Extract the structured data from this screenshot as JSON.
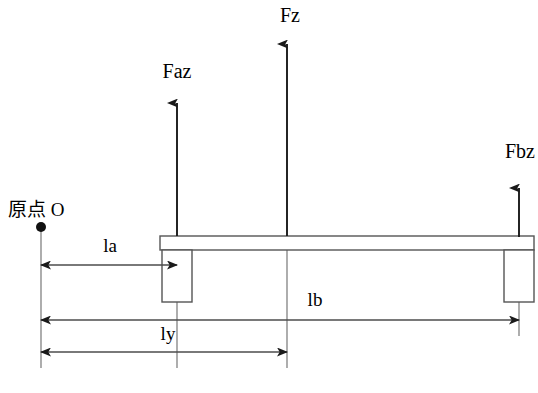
{
  "diagram": {
    "origin_label": "原点 O",
    "forces": [
      {
        "name": "Faz",
        "label": "Faz",
        "x": 177,
        "tail_y": 236,
        "head_y": 97,
        "label_x": 177,
        "label_y": 78
      },
      {
        "name": "Fz",
        "label": "Fz",
        "x": 287,
        "tail_y": 236,
        "head_y": 38,
        "label_x": 290,
        "label_y": 22
      },
      {
        "name": "Fbz",
        "label": "Fbz",
        "x": 519,
        "tail_y": 237,
        "head_y": 182,
        "label_x": 520,
        "label_y": 158
      }
    ],
    "dimensions": [
      {
        "name": "la",
        "label": "la",
        "x1": 41,
        "x2": 177,
        "y": 265,
        "label_x": 110,
        "label_y": 252,
        "both_arrows": true
      },
      {
        "name": "lb",
        "label": "lb",
        "x1": 41,
        "x2": 519,
        "y": 320,
        "label_x": 315,
        "label_y": 306,
        "both_arrows": true
      },
      {
        "name": "ly",
        "label": "ly",
        "x1": 41,
        "x2": 287,
        "y": 352,
        "label_x": 168,
        "label_y": 340,
        "both_arrows": true
      }
    ],
    "origin": {
      "dot_x": 41,
      "dot_y": 227,
      "label_x": 8,
      "label_y": 216
    },
    "beam": {
      "x1": 160,
      "x2": 534,
      "top_y": 236,
      "bottom_y": 250
    },
    "supports": [
      {
        "name": "left-support",
        "x1": 162,
        "x2": 192,
        "top_y": 250,
        "bottom_y": 302
      },
      {
        "name": "right-support",
        "x1": 504,
        "x2": 534,
        "top_y": 250,
        "bottom_y": 302
      }
    ],
    "colors": {
      "stroke": "#555555",
      "arrow": "#1a1a1a",
      "dimension": "#4d4d4d",
      "extension": "#777777",
      "background": "#ffffff"
    }
  }
}
